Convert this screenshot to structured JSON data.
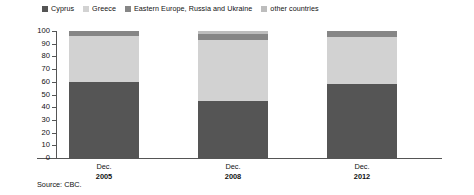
{
  "chart_data": {
    "type": "bar",
    "subtype": "stacked-100-percent",
    "title": "",
    "subtitle": "",
    "xlabel": "",
    "ylabel": "",
    "ylim": [
      0,
      100
    ],
    "yticks": [
      0,
      10,
      20,
      30,
      40,
      50,
      60,
      70,
      80,
      90,
      100
    ],
    "ytick_labels": [
      "0",
      "10",
      "20",
      "30",
      "40",
      "50",
      "60",
      "70",
      "80",
      "90",
      "100"
    ],
    "grid": false,
    "legend_position": "top-left",
    "categories": [
      "Dec. 2005",
      "Dec. 2008",
      "Dec. 2012"
    ],
    "category_lines": [
      {
        "line1": "Dec.",
        "line2": "2005"
      },
      {
        "line1": "Dec.",
        "line2": "2008"
      },
      {
        "line1": "Dec.",
        "line2": "2012"
      }
    ],
    "series": [
      {
        "name": "Cyprus",
        "color": "#555555",
        "values": [
          60,
          45,
          58
        ]
      },
      {
        "name": "Greece",
        "color": "#d2d2d2",
        "values": [
          36,
          48,
          37
        ]
      },
      {
        "name": "Eastern Europe, Russia and Ukraine",
        "color": "#868686",
        "values": [
          4,
          5,
          5
        ]
      },
      {
        "name": "other countries",
        "color": "#bdbdbd",
        "values": [
          0,
          2,
          0
        ]
      }
    ],
    "annotations": [
      "Source: CBC."
    ]
  },
  "legend": {
    "entries": [
      {
        "label": "Cyprus",
        "color": "#555555"
      },
      {
        "label": "Greece",
        "color": "#d2d2d2"
      },
      {
        "label": "Eastern Europe, Russia and Ukraine",
        "color": "#868686"
      },
      {
        "label": "other countries",
        "color": "#bdbdbd"
      }
    ]
  },
  "source": {
    "text": "Source: CBC."
  },
  "colors": {
    "axis": "#555555",
    "text": "#111111",
    "background": "#ffffff"
  }
}
